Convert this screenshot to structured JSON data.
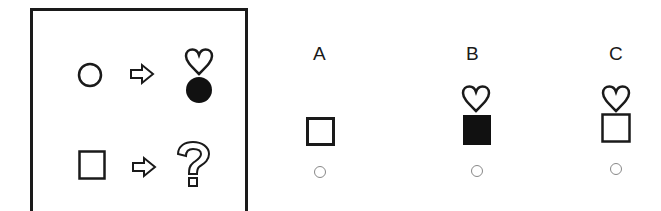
{
  "puzzle": {
    "example_rows": [
      {
        "input": "circle-outline",
        "arrow": "right-arrow-outline",
        "output": [
          "heart-outline",
          "circle-filled"
        ]
      },
      {
        "input": "square-outline",
        "arrow": "right-arrow-outline",
        "output": [
          "question-mark-outline"
        ]
      }
    ]
  },
  "options": [
    {
      "label": "A",
      "shapes": [
        "square-outline"
      ]
    },
    {
      "label": "B",
      "shapes": [
        "heart-outline",
        "square-filled"
      ]
    },
    {
      "label": "C",
      "shapes": [
        "heart-outline",
        "square-outline"
      ]
    }
  ],
  "colors": {
    "ink": "#1a1a1a",
    "radio": "#888888"
  }
}
